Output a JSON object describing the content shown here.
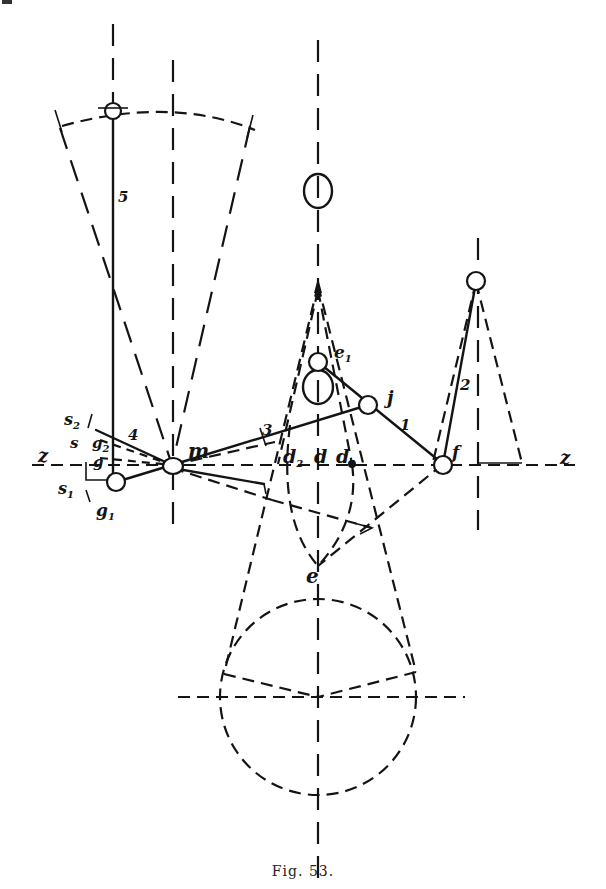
{
  "figure": {
    "caption": "Fig. 53.",
    "ink_color": "#141414",
    "background": "#ffffff"
  },
  "labels": {
    "link_1": "1",
    "link_2": "2",
    "link_3": "3",
    "link_4": "4",
    "link_5": "5",
    "point_m": "m",
    "point_j": "j",
    "point_f": "f",
    "point_e": "e",
    "point_e1": "e",
    "point_e1_sub": "1",
    "point_d": "d",
    "point_d1": "d",
    "point_d1_sub": "1",
    "point_d2": "d",
    "point_d2_sub": "2",
    "point_g": "g",
    "point_g1": "g",
    "point_g1_sub": "1",
    "point_g2": "g",
    "point_g2_sub": "2",
    "point_s": "s",
    "point_s1": "s",
    "point_s1_sub": "1",
    "point_s2": "s",
    "point_s2_sub": "2",
    "axis_z_left": "z",
    "axis_z_right": "z"
  },
  "points": {
    "m": [
      172,
      465
    ],
    "g1": [
      116,
      482
    ],
    "pivot5": [
      113,
      110
    ],
    "e1": [
      318,
      362
    ],
    "j": [
      368,
      405
    ],
    "f": [
      443,
      464
    ],
    "pivot2": [
      476,
      282
    ],
    "e": [
      318,
      566
    ],
    "d": [
      318,
      464
    ],
    "d1": [
      352,
      464
    ],
    "d2": [
      280,
      464
    ],
    "circle_center": [
      318,
      697
    ]
  }
}
